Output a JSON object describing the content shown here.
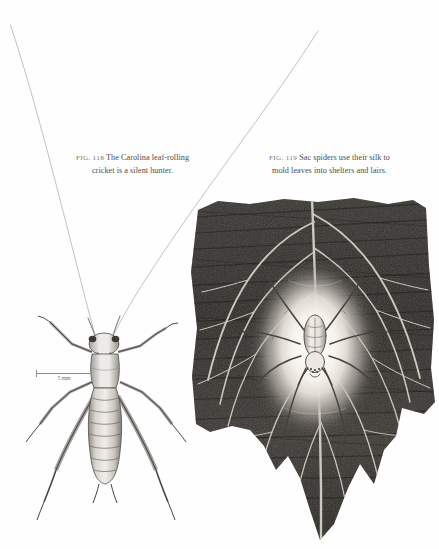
{
  "page": {
    "background": "#fefefe",
    "ink": "#4e4c4a"
  },
  "figures": [
    {
      "id": "fig-118",
      "number": "FIG. 118",
      "caption": "The Carolina leaf-rolling cricket is a silent hunter.",
      "caption_line_1": "The Carolina leaf-rolling",
      "caption_line_2": "cricket is a silent hunter.",
      "subject": "carolina-leaf-rolling-cricket",
      "medium": "pen-and-ink drawing",
      "scale_bar": {
        "label": "5 mm",
        "length_px": 56
      }
    },
    {
      "id": "fig-119",
      "number": "FIG. 119",
      "caption": "Sac spiders use their silk to mold leaves into shelters and lairs.",
      "caption_line_1": "Sac spiders use their silk to",
      "caption_line_2": "mold leaves into shelters and lairs.",
      "subject": "sac-spider-in-silk-retreat",
      "medium": "graphite drawing"
    }
  ],
  "colors": {
    "caption_text": "#4e4c4a",
    "fignum_text": "#7a7775",
    "antenna_line": "#b9b7b5",
    "ink_dark": "#3a3836",
    "leaf_dark": "#2e2c2b",
    "leaf_vein": "#d8d4cc",
    "silk_sac": "#f2efe9",
    "scale_rule": "#8e8c8a"
  }
}
